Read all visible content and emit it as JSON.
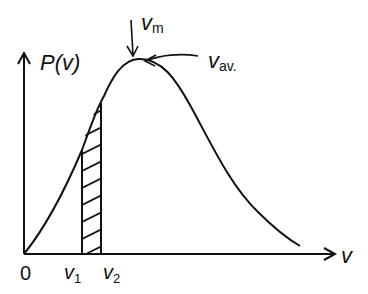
{
  "diagram": {
    "y_axis_label": "P(v)",
    "y_axis_label_parts": {
      "main": "P(",
      "var": "v",
      "close": ")"
    },
    "x_axis_label": "v",
    "origin_label": "0",
    "v1_label": {
      "main": "v",
      "sub": "1"
    },
    "v2_label": {
      "main": "v",
      "sub": "2"
    },
    "vm_label": {
      "main": "v",
      "sub": "m"
    },
    "vav_label": {
      "main": "v",
      "sub": "av."
    },
    "shaded_region": "area between v1 and v2 under curve (hatched)",
    "colors": {
      "stroke": "#111111",
      "background": "#ffffff"
    }
  }
}
